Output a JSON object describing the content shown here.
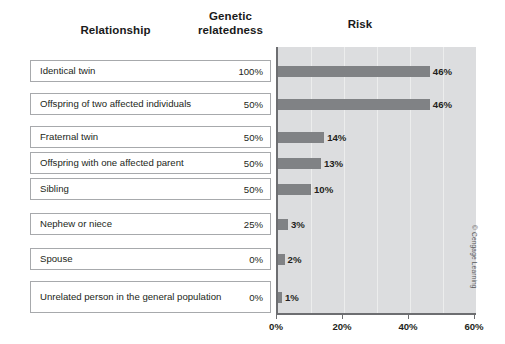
{
  "headers": {
    "relationship": "Relationship",
    "genetic_relatedness": "Genetic\nrelatedness",
    "genetic_line1": "Genetic",
    "genetic_line2": "relatedness",
    "risk": "Risk"
  },
  "rows": [
    {
      "label": "Identical twin",
      "relatedness": "100%",
      "risk_label": "46%",
      "risk": 46
    },
    {
      "label": "Offspring of two affected individuals",
      "relatedness": "50%",
      "risk_label": "46%",
      "risk": 46
    },
    {
      "label": "Fraternal twin",
      "relatedness": "50%",
      "risk_label": "14%",
      "risk": 14
    },
    {
      "label": "Offspring with one affected parent",
      "relatedness": "50%",
      "risk_label": "13%",
      "risk": 13
    },
    {
      "label": "Sibling",
      "relatedness": "50%",
      "risk_label": "10%",
      "risk": 10
    },
    {
      "label": "Nephew or niece",
      "relatedness": "25%",
      "risk_label": "3%",
      "risk": 3
    },
    {
      "label": "Spouse",
      "relatedness": "0%",
      "risk_label": "2%",
      "risk": 2
    },
    {
      "label": "Unrelated person in the general population",
      "relatedness": "0%",
      "risk_label": "1%",
      "risk": 1
    }
  ],
  "axis": {
    "ticks": [
      "0%",
      "20%",
      "40%",
      "60%"
    ],
    "tick_values": [
      0,
      20,
      40,
      60
    ],
    "gridline_values": [
      10,
      20,
      30,
      40,
      50
    ],
    "min": 0,
    "max": 60
  },
  "colors": {
    "bar": "#808285",
    "plot_background": "#dcdddf",
    "gridline": "#eceded",
    "axis": "#6d6e71",
    "row_border": "#a7a9ac",
    "text": "#231f20"
  },
  "copyright": "© Cengage Learning",
  "chart_data": {
    "type": "bar",
    "orientation": "horizontal",
    "title": "Risk",
    "xlabel": "",
    "ylabel": "",
    "categories": [
      "Identical twin",
      "Offspring of two affected individuals",
      "Fraternal twin",
      "Offspring with one affected parent",
      "Sibling",
      "Nephew or niece",
      "Spouse",
      "Unrelated person in the general population"
    ],
    "values": [
      46,
      46,
      14,
      13,
      10,
      3,
      2,
      1
    ],
    "value_labels": [
      "46%",
      "46%",
      "14%",
      "13%",
      "10%",
      "3%",
      "2%",
      "1%"
    ],
    "series": [
      {
        "name": "Risk",
        "values": [
          46,
          46,
          14,
          13,
          10,
          3,
          2,
          1
        ]
      },
      {
        "name": "Genetic relatedness",
        "values": [
          100,
          50,
          50,
          50,
          50,
          25,
          0,
          0
        ]
      }
    ],
    "xlim": [
      0,
      60
    ],
    "xticks": [
      0,
      20,
      40,
      60
    ],
    "xticklabels": [
      "0%",
      "20%",
      "40%",
      "60%"
    ],
    "grid": true,
    "legend": "none"
  }
}
